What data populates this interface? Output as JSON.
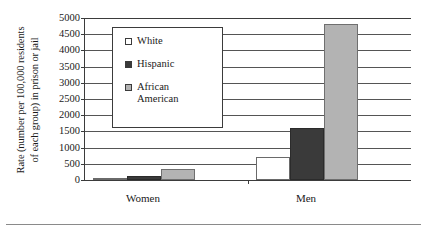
{
  "chart_data": {
    "type": "bar",
    "title": "",
    "xlabel": "",
    "ylabel_line1": "Rate (number per 100,000 residents",
    "ylabel_line2": "of each group) in prison or jail",
    "categories": [
      "Women",
      "Men"
    ],
    "series": [
      {
        "name": "White",
        "key": "white",
        "color": "#ffffff",
        "values": [
          68,
          717
        ]
      },
      {
        "name": "Hispanic",
        "key": "hispanic",
        "color": "#3a3a3a",
        "values": [
          133,
          1610
        ]
      },
      {
        "name": "African\nAmerican",
        "key": "african",
        "color": "#b3b3b3",
        "values": [
          349,
          4810
        ]
      }
    ],
    "ylim": [
      0,
      5000
    ],
    "ytick_values": [
      5000,
      4500,
      4000,
      3500,
      3000,
      2500,
      2000,
      1500,
      1000,
      500,
      0
    ],
    "ytick_labels": [
      "5000",
      "4500",
      "4000",
      "3500",
      "3000",
      "2500",
      "2000",
      "1500",
      "1000",
      "500",
      "0"
    ],
    "grid": true,
    "legend_position": "upper-left-inside"
  },
  "legend": {
    "entries": [
      {
        "label": "White"
      },
      {
        "label": "Hispanic"
      },
      {
        "label": "African\nAmerican"
      }
    ]
  }
}
